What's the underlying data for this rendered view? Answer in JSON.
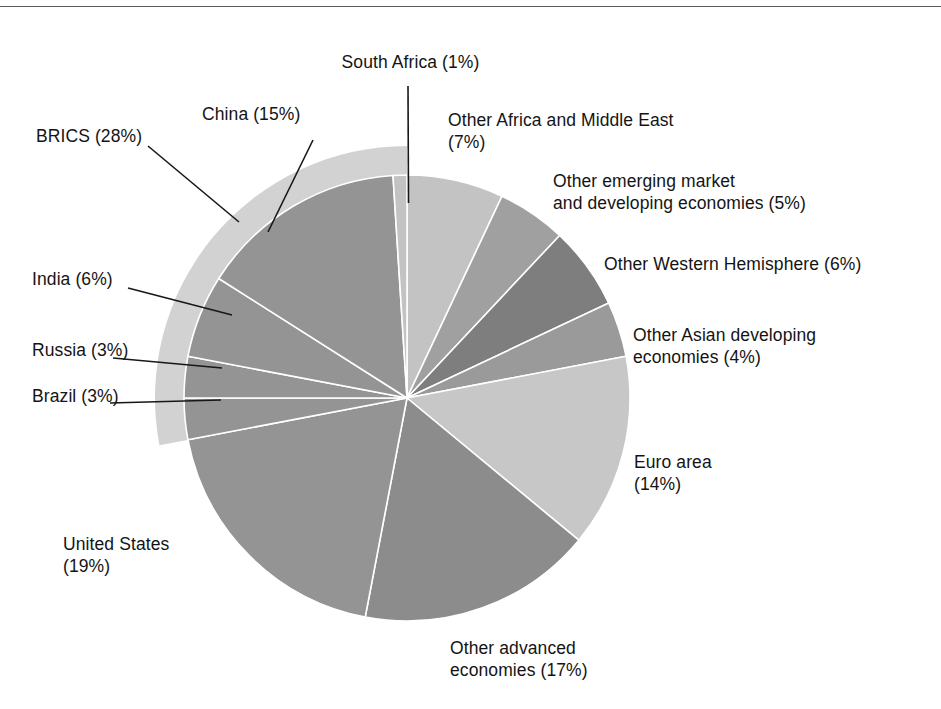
{
  "figure": {
    "top_rule": true,
    "background": "#ffffff",
    "pie": {
      "center_x": 407,
      "center_y": 398,
      "radius": 223,
      "brics_ring_radius": 252,
      "brics_ring_color": "#d2d2d2",
      "divider_color": "#ffffff"
    }
  },
  "chart_data": {
    "type": "pie",
    "title": "",
    "start_angle_deg": 0,
    "direction": "clockwise",
    "unit": "%",
    "categories": [
      "Other Africa and Middle East",
      "Other emerging market and developing economies",
      "Other Western Hemisphere",
      "Other Asian developing economies",
      "Euro area",
      "Other advanced economies",
      "United States",
      "Brazil",
      "Russia",
      "India",
      "China",
      "South Africa"
    ],
    "values": [
      7,
      5,
      6,
      4,
      14,
      17,
      19,
      3,
      3,
      6,
      15,
      1
    ],
    "colors": [
      "#c3c3c3",
      "#a0a0a0",
      "#7e7e7e",
      "#9a9a9a",
      "#c7c7c7",
      "#8c8c8c",
      "#949494",
      "#949494",
      "#949494",
      "#949494",
      "#949494",
      "#c3c3c3"
    ],
    "groups": [
      {
        "name": "BRICS",
        "value": 28,
        "members": [
          "Brazil",
          "Russia",
          "India",
          "China",
          "South Africa"
        ],
        "color": "#d2d2d2"
      }
    ],
    "legend": "none",
    "grid": false
  },
  "labels": {
    "south_africa": "South Africa (1%)",
    "china": "China (15%)",
    "brics": "BRICS (28%)",
    "india": "India (6%)",
    "russia": "Russia (3%)",
    "brazil": "Brazil (3%)",
    "united_states_l1": "United States",
    "united_states_l2": "(19%)",
    "other_advanced_l1": "Other advanced",
    "other_advanced_l2": "economies (17%)",
    "euro_area_l1": "Euro area",
    "euro_area_l2": "(14%)",
    "other_asian_l1": "Other Asian developing",
    "other_asian_l2": "economies (4%)",
    "other_western": "Other Western Hemisphere (6%)",
    "other_emerging_l1": "Other emerging market",
    "other_emerging_l2": "and developing economies (5%)",
    "other_africa_l1": "Other Africa and Middle East",
    "other_africa_l2": "(7%)"
  }
}
